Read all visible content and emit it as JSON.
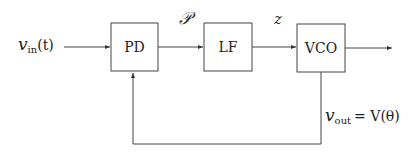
{
  "diagram": {
    "type": "block-diagram",
    "blocks": [
      {
        "id": "pd",
        "label": "PD"
      },
      {
        "id": "lf",
        "label": "LF"
      },
      {
        "id": "vco",
        "label": "VCO"
      }
    ],
    "signals": {
      "input_var": "v",
      "input_sub": "in",
      "input_arg": "(t)",
      "pd_to_lf": "𝒫",
      "lf_to_vco": "z",
      "output_var": "v",
      "output_sub": "out",
      "output_eq": "= V(θ)"
    },
    "edges": [
      {
        "from": "input",
        "to": "pd"
      },
      {
        "from": "pd",
        "to": "lf",
        "label": "𝒫"
      },
      {
        "from": "lf",
        "to": "vco",
        "label": "z"
      },
      {
        "from": "vco",
        "to": "output"
      },
      {
        "from": "vco",
        "to": "pd",
        "label": "v_out = V(θ)",
        "kind": "feedback"
      }
    ]
  }
}
